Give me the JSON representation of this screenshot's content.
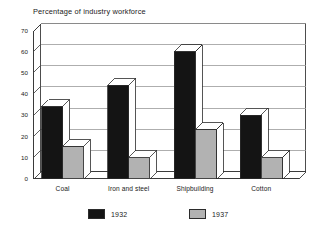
{
  "chart_data": {
    "type": "bar",
    "title": "Percentage of industry workforce",
    "xlabel": "",
    "ylabel": "",
    "ylim": [
      0,
      70
    ],
    "yticks": [
      0,
      10,
      20,
      30,
      40,
      50,
      60,
      70
    ],
    "grid": true,
    "legend_position": "bottom",
    "style": "3d-column",
    "categories": [
      "Coal",
      "Iron and steel",
      "Shipbuilding",
      "Cotton"
    ],
    "series": [
      {
        "name": "1932",
        "color": "#141414",
        "values": [
          34,
          44,
          60,
          30
        ]
      },
      {
        "name": "1937",
        "color": "#b2b2b2",
        "values": [
          15,
          10,
          23,
          10
        ]
      }
    ]
  },
  "axis": {
    "tick_labels": [
      "70",
      "60",
      "50",
      "40",
      "30",
      "20",
      "10",
      "0"
    ]
  },
  "legend": {
    "items": [
      {
        "label": "1932",
        "swatch": "#141414"
      },
      {
        "label": "1937",
        "swatch": "#b2b2b2"
      }
    ]
  },
  "colors": {
    "series_1932": "#141414",
    "series_1937": "#b2b2b2",
    "axis_line": "#3a3a3a",
    "grid_line": "#9a9a9a",
    "bar_top_face": "#ffffff",
    "bar_side_face": "#ffffff",
    "background": "#ffffff",
    "text": "#1a1a1a"
  }
}
